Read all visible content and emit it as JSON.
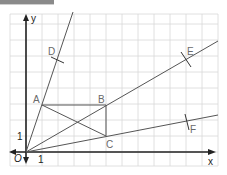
{
  "diagram": {
    "type": "coordinate-grid-construction",
    "axes": {
      "x_label": "x",
      "y_label": "y",
      "origin_label": "O",
      "unit_x_label": "1",
      "unit_y_label": "1"
    },
    "points": {
      "A": {
        "label": "A",
        "coords": [
          1,
          3
        ]
      },
      "B": {
        "label": "B",
        "coords": [
          5,
          3
        ]
      },
      "C": {
        "label": "C",
        "coords": [
          5,
          1
        ]
      },
      "D": {
        "label": "D"
      },
      "E": {
        "label": "E"
      },
      "F": {
        "label": "F"
      }
    },
    "segments": [
      "AB",
      "BC",
      "AC"
    ],
    "rays": [
      "OA (through D)",
      "OB (through E)",
      "OC (through F)"
    ],
    "colors": {
      "grid": "#d8d8d8",
      "axis": "#222222",
      "line": "#555555",
      "label": "#6a6a6a"
    }
  }
}
